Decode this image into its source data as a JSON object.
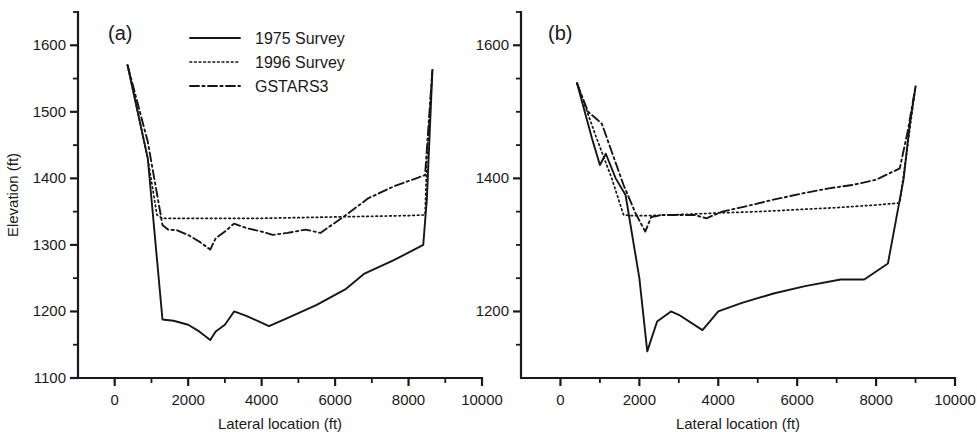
{
  "figure": {
    "width": 977,
    "height": 432,
    "background": "#ffffff",
    "ink_color": "#161616"
  },
  "legend": {
    "position": "top-left-inside-panel-a",
    "entries": [
      {
        "label": "1975 Survey",
        "style": "solid"
      },
      {
        "label": "1996 Survey",
        "style": "dotted"
      },
      {
        "label": "GSTARS3",
        "style": "dash-dot"
      }
    ]
  },
  "axis_titles": {
    "y": "Elevation (ft)",
    "x": "Lateral location (ft)"
  },
  "panels": [
    {
      "tag": "(a)",
      "name": "panel-a"
    },
    {
      "tag": "(b)",
      "name": "panel-b"
    }
  ],
  "chart_data": [
    {
      "type": "line",
      "title": "(a)",
      "xlabel": "Lateral location (ft)",
      "ylabel": "Elevation (ft)",
      "xlim": [
        -1000,
        10000
      ],
      "ylim": [
        1100,
        1650
      ],
      "xticks": [
        0,
        2000,
        4000,
        6000,
        8000,
        10000
      ],
      "xticklabels": [
        "0",
        "2000",
        "4000",
        "6000",
        "8000",
        "10000"
      ],
      "xminorticks": [
        1000,
        3000,
        5000,
        7000,
        9000
      ],
      "yticks": [
        1100,
        1200,
        1300,
        1400,
        1500,
        1600
      ],
      "yticklabels": [
        "1100",
        "1200",
        "1300",
        "1400",
        "1500",
        "1600"
      ],
      "yminorticks": [
        1150,
        1250,
        1350,
        1450,
        1550,
        1650
      ],
      "grid": false,
      "legend": [
        "1975 Survey",
        "1996 Survey",
        "GSTARS3"
      ],
      "series": [
        {
          "name": "1975 Survey",
          "style": "solid",
          "x": [
            350,
            900,
            1300,
            1600,
            2000,
            2300,
            2600,
            2750,
            3000,
            3250,
            3600,
            4200,
            4700,
            5500,
            6300,
            6800,
            7600,
            8400,
            8500,
            8650
          ],
          "y": [
            1570,
            1430,
            1188,
            1186,
            1180,
            1170,
            1157,
            1170,
            1180,
            1200,
            1193,
            1178,
            1190,
            1210,
            1234,
            1257,
            1277,
            1300,
            1370,
            1563
          ]
        },
        {
          "name": "1996 Survey",
          "style": "dotted",
          "x": [
            350,
            900,
            1150,
            1300,
            2000,
            3000,
            4000,
            5000,
            6000,
            7000,
            8000,
            8450,
            8500,
            8650
          ],
          "y": [
            1570,
            1430,
            1345,
            1340,
            1340,
            1340,
            1340,
            1341,
            1342,
            1343,
            1344,
            1345,
            1430,
            1563
          ]
        },
        {
          "name": "GSTARS3",
          "style": "dash-dot",
          "x": [
            350,
            900,
            1300,
            1450,
            1700,
            2000,
            2300,
            2600,
            2750,
            3000,
            3250,
            3600,
            4000,
            4300,
            4700,
            5200,
            5600,
            6300,
            6900,
            7600,
            8300,
            8450,
            8650
          ],
          "y": [
            1570,
            1455,
            1330,
            1323,
            1322,
            1315,
            1305,
            1293,
            1310,
            1320,
            1332,
            1325,
            1320,
            1315,
            1318,
            1323,
            1318,
            1345,
            1370,
            1388,
            1402,
            1405,
            1563
          ]
        }
      ]
    },
    {
      "type": "line",
      "title": "(b)",
      "xlabel": "Lateral location (ft)",
      "ylabel": "Elevation (ft)",
      "xlim": [
        -1000,
        10000
      ],
      "ylim": [
        1100,
        1650
      ],
      "xticks": [
        0,
        2000,
        4000,
        6000,
        8000,
        10000
      ],
      "xticklabels": [
        "0",
        "2000",
        "4000",
        "6000",
        "8000",
        "10000"
      ],
      "xminorticks": [
        1000,
        3000,
        5000,
        7000,
        9000
      ],
      "yticks": [
        1200,
        1400,
        1600
      ],
      "yticklabels": [
        "1200",
        "1400",
        "1600"
      ],
      "yminorticks": [
        1150,
        1250,
        1300,
        1350,
        1450,
        1500,
        1550,
        1650
      ],
      "grid": false,
      "legend": [
        "1975 Survey",
        "1996 Survey",
        "GSTARS3"
      ],
      "series": [
        {
          "name": "1975 Survey",
          "style": "solid",
          "x": [
            420,
            800,
            1000,
            1150,
            1400,
            1650,
            2000,
            2200,
            2450,
            2800,
            3000,
            3600,
            4000,
            4600,
            5400,
            6200,
            7100,
            7700,
            8300,
            8700,
            8850,
            9000
          ],
          "y": [
            1543,
            1460,
            1420,
            1437,
            1400,
            1375,
            1250,
            1140,
            1185,
            1200,
            1195,
            1172,
            1200,
            1213,
            1227,
            1238,
            1248,
            1248,
            1272,
            1400,
            1480,
            1538
          ]
        },
        {
          "name": "1996 Survey",
          "style": "dotted",
          "x": [
            420,
            900,
            1300,
            1600,
            1800,
            2200,
            2700,
            3200,
            4000,
            5000,
            6000,
            7000,
            8000,
            8600,
            8800,
            9000
          ],
          "y": [
            1543,
            1463,
            1400,
            1345,
            1344,
            1344,
            1345,
            1346,
            1348,
            1350,
            1353,
            1356,
            1360,
            1363,
            1450,
            1538
          ]
        },
        {
          "name": "GSTARS3",
          "style": "dash-dot",
          "x": [
            420,
            700,
            900,
            1050,
            1300,
            1600,
            1900,
            2150,
            2300,
            2600,
            3000,
            3400,
            3700,
            4100,
            4700,
            5400,
            6100,
            6800,
            7400,
            8000,
            8350,
            8600,
            8800,
            9000
          ],
          "y": [
            1543,
            1500,
            1490,
            1482,
            1440,
            1390,
            1348,
            1320,
            1342,
            1345,
            1345,
            1345,
            1340,
            1350,
            1358,
            1368,
            1377,
            1385,
            1390,
            1398,
            1408,
            1415,
            1470,
            1538
          ]
        }
      ]
    }
  ]
}
